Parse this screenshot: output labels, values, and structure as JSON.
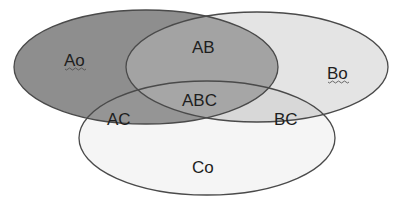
{
  "diagram": {
    "type": "venn-3",
    "sets": [
      {
        "id": "A",
        "cx": 146,
        "cy": 67,
        "rx": 132,
        "ry": 57,
        "fill": "#8a8a8a"
      },
      {
        "id": "B",
        "cx": 257,
        "cy": 67,
        "rx": 131,
        "ry": 55,
        "fill": "#e6e6e6"
      },
      {
        "id": "C",
        "cx": 207,
        "cy": 138,
        "rx": 128,
        "ry": 57,
        "fill": "#f4f4f4"
      }
    ],
    "region_colors": {
      "A_only": "#8e8e8e",
      "B_only": "#e4e4e4",
      "C_only": "#f5f5f5",
      "AB": "#a2a2a2",
      "AC": "#959595",
      "BC": "#d8d8d8",
      "ABC": "#a6a6a6"
    },
    "stroke_color": "#4a4a4a",
    "labels": {
      "a_only": "Ao",
      "b_only": "Bo",
      "c_only": "Co",
      "ab": "AB",
      "ac": "AC",
      "bc": "BC",
      "abc": "ABC"
    }
  }
}
